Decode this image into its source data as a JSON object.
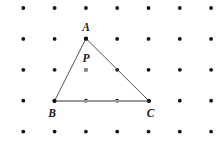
{
  "figure": {
    "background_color": "#ffffff",
    "width": 224,
    "height": 145
  },
  "grid": {
    "name": "dot-lattice",
    "columns": 7,
    "rows": 5,
    "origin_x": 23.3,
    "origin_y": 8.0,
    "spacing_x": 31.3,
    "spacing_y": 30.9,
    "dot_radius": 1.9,
    "dot_color": "#111111"
  },
  "triangle": {
    "name": "triangle-ABC",
    "stroke_color": "#555555",
    "stroke_width": 1.0,
    "base_stroke_color": "#9a9a9a",
    "base_stroke_width": 2.0,
    "fill": "none",
    "vertices": [
      {
        "id": "A",
        "label": "A",
        "x": 86.0,
        "y": 38.5,
        "label_x": 86.0,
        "label_y": 28.0
      },
      {
        "id": "B",
        "label": "B",
        "x": 54.5,
        "y": 101.0,
        "label_x": 52.0,
        "label_y": 114.0
      },
      {
        "id": "C",
        "label": "C",
        "x": 149.0,
        "y": 101.0,
        "label_x": 150.5,
        "label_y": 114.0
      }
    ],
    "edges": [
      {
        "id": "AB",
        "from": "A",
        "to": "B"
      },
      {
        "id": "AC",
        "from": "A",
        "to": "C"
      },
      {
        "id": "BC",
        "from": "B",
        "to": "C",
        "emphasized": true
      }
    ]
  },
  "interior_point": {
    "id": "P",
    "label": "P",
    "x": 86.0,
    "y": 70.0,
    "label_x": 86.0,
    "label_y": 59.0,
    "dot_radius": 2.0,
    "dot_color": "#8d8d8d"
  },
  "vertex_dot": {
    "radius": 2.1,
    "color": "#111111"
  }
}
